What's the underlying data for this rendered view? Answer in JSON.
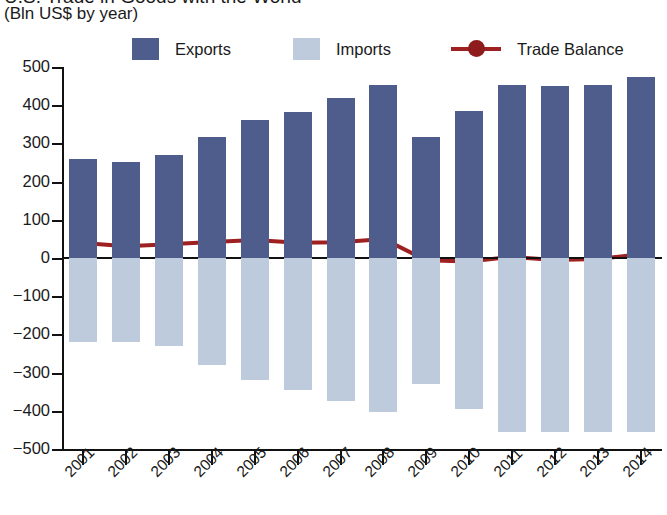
{
  "header": {
    "title_partial": "U.S. Trade in Goods with the World",
    "subtitle": "(Bln US$ by year)"
  },
  "legend": {
    "items": [
      {
        "label": "Exports",
        "type": "swatch",
        "color": "#4e5d8c"
      },
      {
        "label": "Imports",
        "type": "swatch",
        "color": "#bdcbdd"
      },
      {
        "label": "Trade Balance",
        "type": "line-marker",
        "color": "#9e2020"
      }
    ]
  },
  "axes": {
    "y_ticks": [
      "500",
      "400",
      "300",
      "200",
      "100",
      "0",
      "−100",
      "−200",
      "−300",
      "−400",
      "−500"
    ],
    "x_ticks": [
      "2001",
      "2002",
      "2003",
      "2004",
      "2005",
      "2006",
      "2007",
      "2008",
      "2009",
      "2010",
      "2011",
      "2012",
      "2013",
      "2014"
    ]
  },
  "chart_data": {
    "type": "bar",
    "title": "U.S. Trade in Goods with the World",
    "subtitle": "(Bln US$ by year)",
    "xlabel": "",
    "ylabel": "Bln US$",
    "ylim": [
      -500,
      500
    ],
    "ytick_step": 100,
    "grid": false,
    "legend_position": "top",
    "categories": [
      "2001",
      "2002",
      "2003",
      "2004",
      "2005",
      "2006",
      "2007",
      "2008",
      "2009",
      "2010",
      "2011",
      "2012",
      "2013",
      "2014"
    ],
    "series": [
      {
        "name": "Exports",
        "type": "bar",
        "color": "#4e5d8c",
        "values": [
          259,
          251,
          270,
          316,
          361,
          382,
          419,
          453,
          316,
          385,
          452,
          450,
          452,
          474
        ]
      },
      {
        "name": "Imports",
        "type": "bar",
        "color": "#bdcbdd",
        "values": [
          -220,
          -220,
          -230,
          -280,
          -320,
          -345,
          -375,
          -402,
          -330,
          -394,
          -455,
          -455,
          -455,
          -455
        ]
      },
      {
        "name": "Trade Balance",
        "type": "line",
        "color": "#9e2020",
        "values": [
          39,
          31,
          36,
          42,
          47,
          40,
          41,
          50,
          -6,
          -9,
          3,
          -5,
          -3,
          10
        ]
      }
    ]
  }
}
